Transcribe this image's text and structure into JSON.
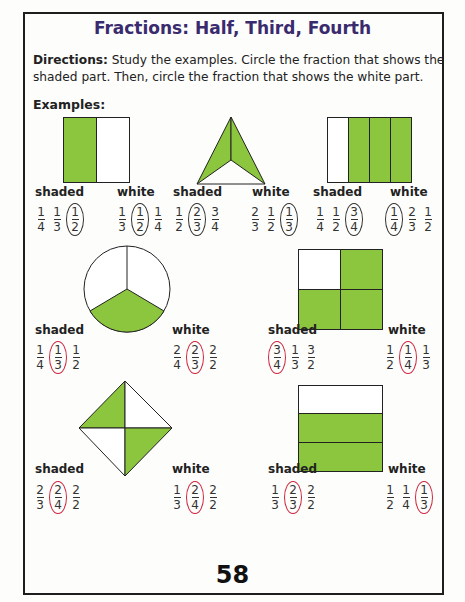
{
  "title": "Fractions: Half, Third, Fourth",
  "directions": {
    "label": "Directions:",
    "text": " Study the examples. Circle the fraction that shows the shaded part. Then, circle the fraction that shows the white part."
  },
  "examples_label": "Examples:",
  "colors": {
    "shaded": "#8cc63f",
    "circle_example": "#333333",
    "circle_answer": "#d0243e",
    "title": "#3a2a6e"
  },
  "problems": [
    {
      "shape": "rectangle-halves",
      "shaded_label": "shaded",
      "white_label": "white",
      "shaded_choices": [
        {
          "n": "1",
          "d": "4"
        },
        {
          "n": "1",
          "d": "3"
        },
        {
          "n": "1",
          "d": "2",
          "circled": true
        }
      ],
      "white_choices": [
        {
          "n": "1",
          "d": "3"
        },
        {
          "n": "1",
          "d": "2",
          "circled": true
        },
        {
          "n": "1",
          "d": "4"
        }
      ]
    },
    {
      "shape": "triangle-thirds",
      "shaded_label": "shaded",
      "white_label": "white",
      "shaded_choices": [
        {
          "n": "1",
          "d": "2"
        },
        {
          "n": "2",
          "d": "3",
          "circled": true
        },
        {
          "n": "3",
          "d": "4"
        }
      ],
      "white_choices": [
        {
          "n": "2",
          "d": "3"
        },
        {
          "n": "1",
          "d": "2"
        },
        {
          "n": "1",
          "d": "3",
          "circled": true
        }
      ]
    },
    {
      "shape": "rectangle-fourths",
      "shaded_label": "shaded",
      "white_label": "white",
      "shaded_choices": [
        {
          "n": "1",
          "d": "4"
        },
        {
          "n": "1",
          "d": "2"
        },
        {
          "n": "3",
          "d": "4",
          "circled": true
        }
      ],
      "white_choices": [
        {
          "n": "1",
          "d": "4",
          "circled": true
        },
        {
          "n": "2",
          "d": "3"
        },
        {
          "n": "1",
          "d": "2"
        }
      ]
    },
    {
      "shape": "circle-thirds",
      "shaded_label": "shaded",
      "white_label": "white",
      "shaded_choices": [
        {
          "n": "1",
          "d": "4"
        },
        {
          "n": "1",
          "d": "3",
          "circled": true
        },
        {
          "n": "1",
          "d": "2"
        }
      ],
      "white_choices": [
        {
          "n": "2",
          "d": "4"
        },
        {
          "n": "2",
          "d": "3",
          "circled": true
        },
        {
          "n": "2",
          "d": "2"
        }
      ]
    },
    {
      "shape": "square-fourths",
      "shaded_label": "shaded",
      "white_label": "white",
      "shaded_choices": [
        {
          "n": "3",
          "d": "4",
          "circled": true
        },
        {
          "n": "1",
          "d": "3"
        },
        {
          "n": "3",
          "d": "2"
        }
      ],
      "white_choices": [
        {
          "n": "1",
          "d": "2"
        },
        {
          "n": "1",
          "d": "4",
          "circled": true
        },
        {
          "n": "1",
          "d": "3"
        }
      ]
    },
    {
      "shape": "diamond-fourths",
      "shaded_label": "shaded",
      "white_label": "white",
      "shaded_choices": [
        {
          "n": "2",
          "d": "3"
        },
        {
          "n": "2",
          "d": "4",
          "circled": true
        },
        {
          "n": "2",
          "d": "2"
        }
      ],
      "white_choices": [
        {
          "n": "1",
          "d": "3"
        },
        {
          "n": "2",
          "d": "4",
          "circled": true
        },
        {
          "n": "2",
          "d": "2"
        }
      ]
    },
    {
      "shape": "rectangle-thirds-horizontal",
      "shaded_label": "shaded",
      "white_label": "white",
      "shaded_choices": [
        {
          "n": "1",
          "d": "3"
        },
        {
          "n": "2",
          "d": "3",
          "circled": true
        },
        {
          "n": "2",
          "d": "2"
        }
      ],
      "white_choices": [
        {
          "n": "1",
          "d": "2"
        },
        {
          "n": "1",
          "d": "4"
        },
        {
          "n": "1",
          "d": "3",
          "circled": true
        }
      ]
    }
  ],
  "page_number": "58"
}
